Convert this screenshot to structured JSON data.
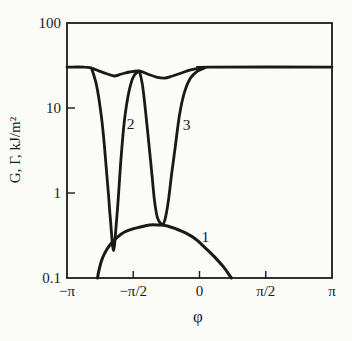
{
  "figure": {
    "background": "#fbfbf8",
    "ink": "#1b1b1b"
  },
  "chart_data": {
    "type": "line",
    "title": "",
    "xlabel": "φ",
    "ylabel": "G, Γ, kJ/m²",
    "x_units": "phi expressed as multiples of π",
    "xlim": [
      -1,
      1
    ],
    "ylim": [
      0.1,
      100
    ],
    "y_scale": "log",
    "grid": false,
    "x_ticks": [
      {
        "value": -1.0,
        "label": "−π",
        "mark": false
      },
      {
        "value": -0.5,
        "label": "−π/2",
        "mark": true
      },
      {
        "value": 0.0,
        "label": "0",
        "mark": true
      },
      {
        "value": 0.5,
        "label": "π/2",
        "mark": true
      },
      {
        "value": 1.0,
        "label": "π",
        "mark": false
      }
    ],
    "y_ticks": [
      {
        "value": 100,
        "label": "100",
        "mark": false
      },
      {
        "value": 10,
        "label": "10",
        "mark": true
      },
      {
        "value": 1,
        "label": "1",
        "mark": true
      },
      {
        "value": 0.1,
        "label": "0.1",
        "mark": false
      }
    ],
    "series": [
      {
        "name": "gamma-plateau-envelope",
        "label": "",
        "stroke_width": 2.8,
        "points": [
          [
            -1.0,
            30.3
          ],
          [
            -0.868,
            30.3
          ],
          [
            -0.815,
            29.5
          ],
          [
            -0.755,
            27.2
          ],
          [
            -0.694,
            25.1
          ],
          [
            -0.642,
            23.8
          ],
          [
            -0.589,
            25.1
          ],
          [
            -0.528,
            26.5
          ],
          [
            -0.453,
            27.2
          ],
          [
            -0.392,
            25.1
          ],
          [
            -0.325,
            23.1
          ],
          [
            -0.264,
            22.5
          ],
          [
            -0.204,
            23.8
          ],
          [
            -0.136,
            25.8
          ],
          [
            -0.075,
            27.9
          ],
          [
            0.0,
            29.5
          ],
          [
            0.075,
            30.3
          ],
          [
            1.0,
            30.3
          ]
        ]
      },
      {
        "name": "curve-2-notch",
        "label": "2",
        "stroke_width": 2.8,
        "points": [
          [
            -0.815,
            29.5
          ],
          [
            -0.777,
            18.6
          ],
          [
            -0.747,
            9.5
          ],
          [
            -0.725,
            4.8
          ],
          [
            -0.709,
            2.44
          ],
          [
            -0.687,
            0.95
          ],
          [
            -0.672,
            0.48
          ],
          [
            -0.649,
            0.21
          ],
          [
            -0.626,
            0.48
          ],
          [
            -0.611,
            0.95
          ],
          [
            -0.596,
            2.13
          ],
          [
            -0.574,
            5.5
          ],
          [
            -0.551,
            10.8
          ],
          [
            -0.521,
            18.6
          ],
          [
            -0.491,
            24.4
          ],
          [
            -0.453,
            27.2
          ]
        ]
      },
      {
        "name": "curve-3-notch",
        "label": "3",
        "stroke_width": 2.8,
        "points": [
          [
            -0.453,
            27.2
          ],
          [
            -0.43,
            18.6
          ],
          [
            -0.408,
            9.5
          ],
          [
            -0.385,
            4.2
          ],
          [
            -0.362,
            1.86
          ],
          [
            -0.34,
            0.83
          ],
          [
            -0.317,
            0.51
          ],
          [
            -0.279,
            0.43
          ],
          [
            -0.257,
            0.51
          ],
          [
            -0.234,
            0.83
          ],
          [
            -0.211,
            1.63
          ],
          [
            -0.181,
            3.67
          ],
          [
            -0.151,
            8.3
          ],
          [
            -0.113,
            15.4
          ],
          [
            -0.068,
            22.5
          ],
          [
            -0.015,
            27.2
          ],
          [
            0.038,
            29.5
          ]
        ]
      },
      {
        "name": "curve-1-dome",
        "label": "1",
        "stroke_width": 3.0,
        "points": [
          [
            -0.77,
            0.1
          ],
          [
            -0.755,
            0.131
          ],
          [
            -0.732,
            0.172
          ],
          [
            -0.702,
            0.214
          ],
          [
            -0.664,
            0.258
          ],
          [
            -0.619,
            0.303
          ],
          [
            -0.566,
            0.348
          ],
          [
            -0.506,
            0.377
          ],
          [
            -0.445,
            0.398
          ],
          [
            -0.377,
            0.42
          ],
          [
            -0.309,
            0.42
          ],
          [
            -0.242,
            0.409
          ],
          [
            -0.174,
            0.377
          ],
          [
            -0.106,
            0.339
          ],
          [
            -0.03,
            0.288
          ],
          [
            0.045,
            0.225
          ],
          [
            0.113,
            0.177
          ],
          [
            0.181,
            0.135
          ],
          [
            0.241,
            0.1
          ]
        ]
      }
    ],
    "annotations": [
      {
        "text": "1",
        "x": 0.045,
        "y": 0.3
      },
      {
        "text": "2",
        "x": -0.52,
        "y": 6.5
      },
      {
        "text": "3",
        "x": -0.098,
        "y": 6.3
      }
    ]
  }
}
